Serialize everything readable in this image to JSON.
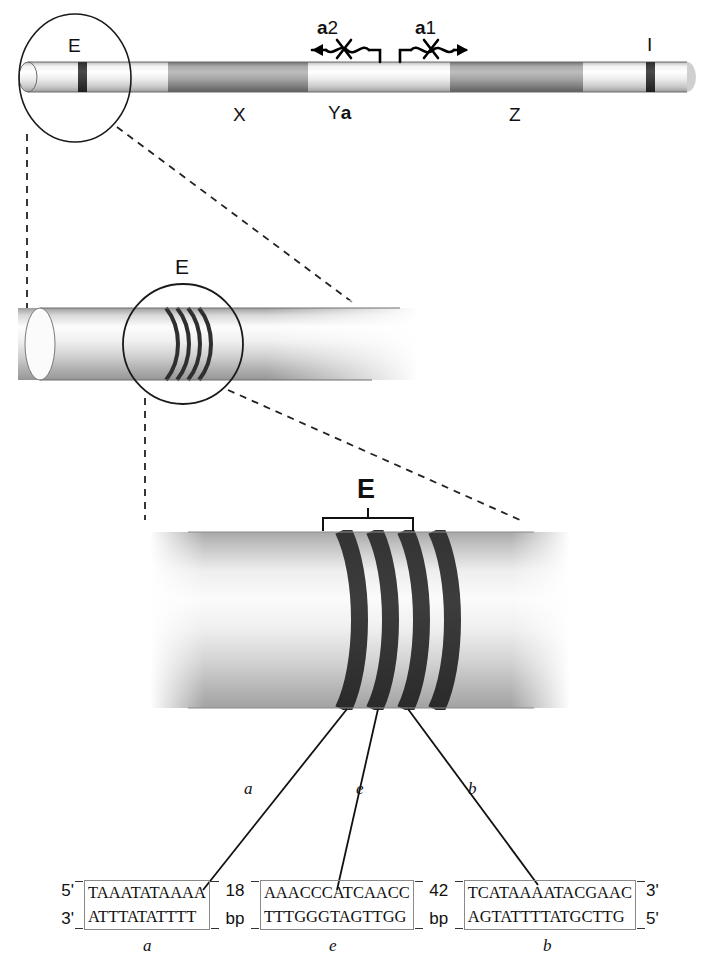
{
  "figure": {
    "panel1": {
      "name": "chromosome-overview",
      "circle_label": "E",
      "segments": [
        {
          "id": "X",
          "label": "X"
        },
        {
          "id": "Ya",
          "label_prefix": "Y",
          "label_bold": "a",
          "label": "Ya"
        },
        {
          "id": "Z",
          "label": "Z"
        }
      ],
      "bands": [
        {
          "id": "E",
          "label": "E"
        },
        {
          "id": "I",
          "label": "I"
        }
      ],
      "transcripts": [
        {
          "id": "a2",
          "prefix": "a",
          "suffix": "2",
          "label": "a2",
          "direction": "left"
        },
        {
          "id": "a1",
          "prefix": "a",
          "suffix": "1",
          "label": "a1",
          "direction": "right"
        }
      ]
    },
    "panel2": {
      "name": "cylinder-magnification",
      "circle_label": "E",
      "band_count": 4
    },
    "panel3": {
      "name": "band-magnification",
      "bracket_label": "E",
      "band_count": 4,
      "leaders": [
        {
          "id": "a",
          "label": "a"
        },
        {
          "id": "e",
          "label": "e"
        },
        {
          "id": "b",
          "label": "b"
        }
      ]
    },
    "sequence_panel": {
      "name": "dna-sequence-row",
      "left_end_top": "5'",
      "left_end_bottom": "3'",
      "right_end_top": "3'",
      "right_end_bottom": "5'",
      "gaps": [
        {
          "value": "18",
          "unit": "bp"
        },
        {
          "value": "42",
          "unit": "bp"
        }
      ],
      "boxes": [
        {
          "id": "a",
          "label": "a",
          "top": "TAAATATAAAA",
          "bottom": "ATTTATATTTT"
        },
        {
          "id": "e",
          "label": "e",
          "top": "AAACCCATCAACC",
          "bottom": "TTTGGGTAGTTGG"
        },
        {
          "id": "b",
          "label": "b",
          "top": "TCATAAAATACGAAC",
          "bottom": "AGTATTTTATGCTTG"
        }
      ]
    },
    "colors": {
      "ink": "#111111",
      "band_dark": "#3a3a3a",
      "segment_dark": "#8f8f8f",
      "segment_light": "#e8e8e8",
      "box_border": "#8a8a8a"
    }
  }
}
